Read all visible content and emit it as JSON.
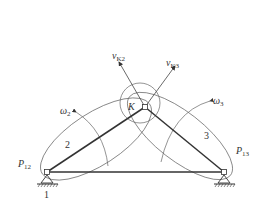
{
  "diagram": {
    "type": "mechanism-instant-centers",
    "labels": {
      "v_k2": {
        "main": "v",
        "sub": "K2"
      },
      "v_k3": {
        "main": "v",
        "sub": "K3"
      },
      "omega2": {
        "main": "ω",
        "sub": "2"
      },
      "omega3": {
        "main": "ω",
        "sub": "3"
      },
      "point_k": "K",
      "link2": "2",
      "link3": "3",
      "p12": {
        "main": "P",
        "sub": "12"
      },
      "p13": {
        "main": "P",
        "sub": "13"
      },
      "ground": "1"
    },
    "colors": {
      "line": "#333333",
      "thin": "#555555",
      "background": "#ffffff"
    }
  }
}
